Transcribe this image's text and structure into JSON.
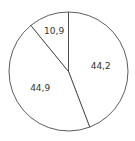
{
  "chart_data": {
    "type": "pie",
    "title": "",
    "slices": [
      {
        "label": "44,2",
        "value": 44.2
      },
      {
        "label": "44,9",
        "value": 44.9
      },
      {
        "label": "10,9",
        "value": 10.9
      }
    ],
    "start": "12 o'clock",
    "direction": "clockwise",
    "colors": {
      "fill": "#ffffff",
      "stroke": "#333333"
    }
  }
}
